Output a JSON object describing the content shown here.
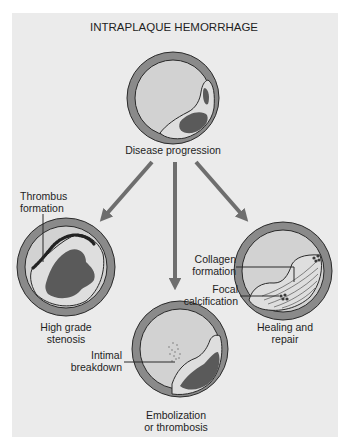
{
  "figure": {
    "title": "INTRAPLAQUE HEMORRHAGE",
    "colors": {
      "background": "#ebebeb",
      "vessel_wall": "#8a8a8a",
      "lumen": "#d2d2d2",
      "plaque": "#dedede",
      "hemorrhage": "#5a5a5a",
      "arrow": "#6e6e6e",
      "outline": "#2a2a2a"
    },
    "stages": {
      "top": {
        "label": "Disease progression"
      },
      "left": {
        "label_line1": "High grade",
        "label_line2": "stenosis",
        "callouts": [
          {
            "line1": "Thrombus",
            "line2": "formation"
          }
        ]
      },
      "right": {
        "label_line1": "Healing and",
        "label_line2": "repair",
        "callouts": [
          {
            "line1": "Collagen",
            "line2": "formation"
          },
          {
            "line1": "Focal",
            "line2": "calcification"
          }
        ]
      },
      "bottom": {
        "label_line1": "Embolization",
        "label_line2": "or thrombosis",
        "callouts": [
          {
            "line1": "Intimal",
            "line2": "breakdown"
          }
        ]
      }
    },
    "arrows": [
      {
        "name": "to-high-grade-stenosis",
        "from": [
          152,
          162
        ],
        "to": [
          100,
          222
        ]
      },
      {
        "name": "to-embolization",
        "from": [
          175,
          162
        ],
        "to": [
          175,
          292
        ]
      },
      {
        "name": "to-healing",
        "from": [
          196,
          162
        ],
        "to": [
          248,
          222
        ]
      }
    ]
  }
}
